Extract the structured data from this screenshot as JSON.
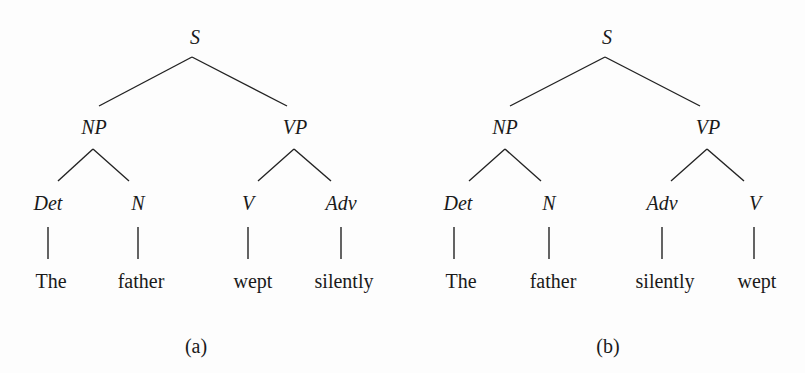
{
  "diagram": {
    "type": "syntax-tree-comparison",
    "trees": [
      {
        "caption": "(a)",
        "root": "S",
        "phrases": [
          "NP",
          "VP"
        ],
        "categories": [
          "Det",
          "N",
          "V",
          "Adv"
        ],
        "words": [
          "The",
          "father",
          "wept",
          "silently"
        ],
        "structure": "[S [NP [Det The] [N father]] [VP [V wept] [Adv silently]]]"
      },
      {
        "caption": "(b)",
        "root": "S",
        "phrases": [
          "NP",
          "VP"
        ],
        "categories": [
          "Det",
          "N",
          "Adv",
          "V"
        ],
        "words": [
          "The",
          "father",
          "silently",
          "wept"
        ],
        "structure": "[S [NP [Det The] [N father]] [VP [Adv silently] [V wept]]]"
      }
    ],
    "colors": {
      "background": "#fdfdfd",
      "ink": "#1a1a1a"
    }
  }
}
